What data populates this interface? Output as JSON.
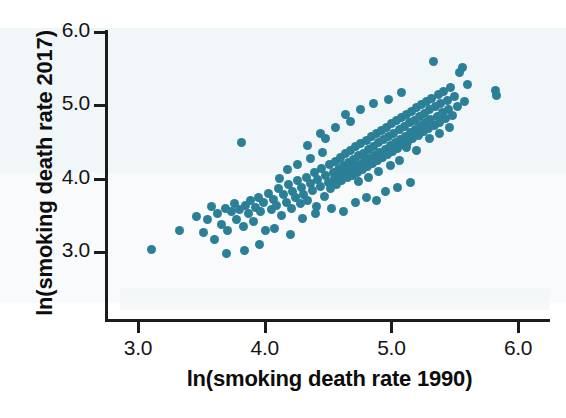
{
  "chart_data": {
    "type": "scatter",
    "title": "",
    "xlabel": "ln(smoking death rate 1990)",
    "ylabel": "ln(smoking death rate 2017)",
    "xlim": [
      2.85,
      6.1
    ],
    "ylim": [
      2.78,
      6.15
    ],
    "xticks": [
      "3.0",
      "4.0",
      "5.0",
      "6.0"
    ],
    "yticks": [
      "3.0",
      "4.0",
      "5.0",
      "6.0"
    ],
    "xtick_values": [
      3.0,
      4.0,
      5.0,
      6.0
    ],
    "ytick_values": [
      3.0,
      4.0,
      5.0,
      6.0
    ],
    "grid": false,
    "legend": "none",
    "marker_color": "#2b7f96",
    "marker_size_px": 9,
    "n_points": 195,
    "points": [
      [
        3.11,
        3.03
      ],
      [
        3.33,
        3.3
      ],
      [
        3.46,
        3.48
      ],
      [
        3.52,
        3.26
      ],
      [
        3.55,
        3.45
      ],
      [
        3.58,
        3.62
      ],
      [
        3.6,
        3.17
      ],
      [
        3.63,
        3.52
      ],
      [
        3.66,
        3.38
      ],
      [
        3.69,
        3.6
      ],
      [
        3.71,
        3.3
      ],
      [
        3.74,
        3.55
      ],
      [
        3.76,
        3.66
      ],
      [
        3.78,
        3.44
      ],
      [
        3.8,
        3.58
      ],
      [
        3.82,
        4.5
      ],
      [
        3.83,
        3.35
      ],
      [
        3.85,
        3.64
      ],
      [
        3.87,
        3.52
      ],
      [
        3.89,
        3.7
      ],
      [
        3.91,
        3.42
      ],
      [
        3.93,
        3.61
      ],
      [
        3.95,
        3.74
      ],
      [
        3.97,
        3.55
      ],
      [
        3.99,
        3.68
      ],
      [
        4.01,
        3.3
      ],
      [
        4.03,
        3.8
      ],
      [
        4.05,
        3.58
      ],
      [
        4.07,
        3.72
      ],
      [
        4.09,
        3.64
      ],
      [
        4.11,
        3.86
      ],
      [
        4.13,
        3.5
      ],
      [
        4.15,
        3.78
      ],
      [
        4.17,
        3.68
      ],
      [
        4.19,
        3.92
      ],
      [
        4.21,
        3.6
      ],
      [
        4.22,
        3.83
      ],
      [
        4.24,
        3.74
      ],
      [
        4.26,
        3.98
      ],
      [
        4.28,
        3.66
      ],
      [
        4.29,
        3.88
      ],
      [
        4.31,
        3.79
      ],
      [
        4.33,
        4.02
      ],
      [
        4.34,
        3.7
      ],
      [
        4.36,
        3.94
      ],
      [
        4.38,
        3.84
      ],
      [
        4.39,
        4.08
      ],
      [
        4.41,
        3.62
      ],
      [
        4.42,
        3.99
      ],
      [
        4.44,
        3.9
      ],
      [
        4.45,
        4.14
      ],
      [
        4.47,
        3.76
      ],
      [
        4.48,
        4.04
      ],
      [
        4.5,
        3.95
      ],
      [
        4.51,
        4.19
      ],
      [
        4.52,
        3.86
      ],
      [
        4.54,
        4.09
      ],
      [
        4.55,
        4.0
      ],
      [
        4.56,
        4.24
      ],
      [
        4.57,
        3.92
      ],
      [
        4.58,
        4.13
      ],
      [
        4.59,
        4.04
      ],
      [
        4.6,
        4.29
      ],
      [
        4.61,
        3.97
      ],
      [
        4.62,
        4.18
      ],
      [
        4.63,
        4.08
      ],
      [
        4.64,
        4.34
      ],
      [
        4.65,
        4.01
      ],
      [
        4.66,
        4.22
      ],
      [
        4.67,
        4.12
      ],
      [
        4.68,
        4.39
      ],
      [
        4.69,
        4.05
      ],
      [
        4.7,
        4.26
      ],
      [
        4.71,
        4.16
      ],
      [
        4.72,
        4.44
      ],
      [
        4.73,
        4.09
      ],
      [
        4.74,
        4.31
      ],
      [
        4.75,
        4.2
      ],
      [
        4.76,
        4.48
      ],
      [
        4.77,
        4.13
      ],
      [
        4.78,
        4.35
      ],
      [
        4.79,
        4.24
      ],
      [
        4.8,
        4.52
      ],
      [
        4.81,
        4.17
      ],
      [
        4.82,
        4.4
      ],
      [
        4.83,
        4.28
      ],
      [
        4.84,
        4.57
      ],
      [
        4.85,
        4.21
      ],
      [
        4.86,
        4.44
      ],
      [
        4.87,
        4.32
      ],
      [
        4.88,
        4.61
      ],
      [
        4.89,
        4.25
      ],
      [
        4.9,
        4.49
      ],
      [
        4.91,
        4.36
      ],
      [
        4.92,
        4.66
      ],
      [
        4.93,
        4.29
      ],
      [
        4.94,
        4.53
      ],
      [
        4.95,
        4.4
      ],
      [
        4.96,
        4.7
      ],
      [
        4.97,
        4.33
      ],
      [
        4.98,
        4.58
      ],
      [
        4.99,
        4.45
      ],
      [
        5.0,
        4.75
      ],
      [
        5.01,
        4.37
      ],
      [
        5.02,
        4.62
      ],
      [
        5.03,
        4.49
      ],
      [
        5.04,
        4.79
      ],
      [
        5.05,
        4.41
      ],
      [
        5.06,
        4.67
      ],
      [
        5.07,
        4.54
      ],
      [
        5.08,
        4.84
      ],
      [
        5.09,
        4.46
      ],
      [
        5.1,
        4.71
      ],
      [
        5.11,
        4.58
      ],
      [
        5.12,
        4.88
      ],
      [
        5.13,
        4.5
      ],
      [
        5.14,
        4.76
      ],
      [
        5.15,
        4.63
      ],
      [
        5.16,
        4.92
      ],
      [
        5.17,
        4.55
      ],
      [
        5.18,
        4.8
      ],
      [
        5.19,
        4.67
      ],
      [
        5.2,
        4.97
      ],
      [
        5.21,
        4.59
      ],
      [
        5.22,
        4.85
      ],
      [
        5.23,
        4.72
      ],
      [
        5.24,
        5.01
      ],
      [
        5.25,
        4.64
      ],
      [
        5.26,
        4.89
      ],
      [
        5.27,
        4.76
      ],
      [
        5.28,
        5.06
      ],
      [
        5.29,
        4.68
      ],
      [
        5.3,
        4.94
      ],
      [
        5.31,
        4.81
      ],
      [
        5.32,
        5.1
      ],
      [
        5.33,
        5.6
      ],
      [
        5.34,
        4.73
      ],
      [
        5.35,
        4.98
      ],
      [
        5.36,
        4.85
      ],
      [
        5.37,
        5.15
      ],
      [
        5.38,
        4.77
      ],
      [
        5.39,
        5.03
      ],
      [
        5.4,
        4.9
      ],
      [
        5.41,
        5.19
      ],
      [
        5.43,
        4.82
      ],
      [
        5.44,
        5.07
      ],
      [
        5.45,
        4.94
      ],
      [
        5.47,
        5.24
      ],
      [
        5.48,
        4.86
      ],
      [
        5.5,
        5.12
      ],
      [
        5.52,
        4.99
      ],
      [
        5.54,
        5.45
      ],
      [
        5.56,
        5.52
      ],
      [
        5.58,
        5.05
      ],
      [
        5.6,
        5.28
      ],
      [
        5.82,
        5.21
      ],
      [
        5.83,
        5.14
      ],
      [
        4.3,
        3.46
      ],
      [
        4.4,
        3.52
      ],
      [
        4.53,
        3.6
      ],
      [
        4.62,
        3.55
      ],
      [
        4.72,
        3.68
      ],
      [
        4.8,
        3.75
      ],
      [
        4.88,
        3.7
      ],
      [
        4.95,
        3.82
      ],
      [
        5.05,
        3.88
      ],
      [
        5.15,
        3.95
      ],
      [
        4.2,
        3.24
      ],
      [
        4.08,
        3.32
      ],
      [
        3.96,
        3.1
      ],
      [
        3.7,
        2.98
      ],
      [
        3.84,
        3.02
      ],
      [
        4.44,
        4.62
      ],
      [
        4.56,
        4.7
      ],
      [
        4.68,
        4.78
      ],
      [
        4.34,
        4.45
      ],
      [
        4.48,
        4.55
      ],
      [
        4.64,
        4.88
      ],
      [
        4.76,
        4.95
      ],
      [
        4.86,
        5.02
      ],
      [
        4.98,
        5.08
      ],
      [
        5.08,
        5.18
      ],
      [
        4.18,
        4.12
      ],
      [
        4.26,
        4.2
      ],
      [
        4.36,
        4.28
      ],
      [
        4.46,
        4.36
      ],
      [
        4.12,
        4.0
      ],
      [
        5.12,
        4.42
      ],
      [
        5.2,
        4.38
      ],
      [
        5.3,
        4.55
      ],
      [
        5.38,
        4.62
      ],
      [
        5.46,
        4.7
      ],
      [
        4.99,
        4.18
      ],
      [
        5.06,
        4.25
      ],
      [
        4.9,
        4.1
      ],
      [
        4.82,
        4.02
      ],
      [
        4.74,
        3.96
      ]
    ]
  }
}
